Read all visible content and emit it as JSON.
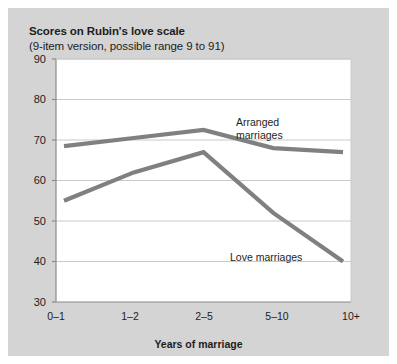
{
  "chart_data": {
    "type": "line",
    "title": "Scores on Rubin's love scale",
    "subtitle": "(9-item version, possible range 9 to 91)",
    "xlabel": "Years of marriage",
    "ylabel": "",
    "categories": [
      "0–1",
      "1–2",
      "2–5",
      "5–10",
      "10+"
    ],
    "ylim": [
      30,
      90
    ],
    "yticks": [
      30,
      40,
      50,
      60,
      70,
      80,
      90
    ],
    "ytick_labels": [
      "30",
      "40",
      "50",
      "60",
      "70",
      "80",
      "90"
    ],
    "grid": true,
    "legend_position": "inline-annotations",
    "series": [
      {
        "name": "Arranged marriages",
        "label_line1": "Arranged",
        "label_line2": "marriages",
        "color": "#808080",
        "values": [
          68.5,
          70.5,
          72.5,
          68,
          67
        ]
      },
      {
        "name": "Love marriages",
        "label_line1": "Love marriages",
        "label_line2": "",
        "color": "#808080",
        "values": [
          55,
          62,
          67,
          52,
          40
        ]
      }
    ],
    "colors": {
      "figure_background": "#d4d4d4",
      "plot_background": "#ffffff",
      "grid": "#c9c9c9",
      "axis": "#8a8a8a",
      "text": "#1d1d1d",
      "line": "#808080"
    }
  }
}
